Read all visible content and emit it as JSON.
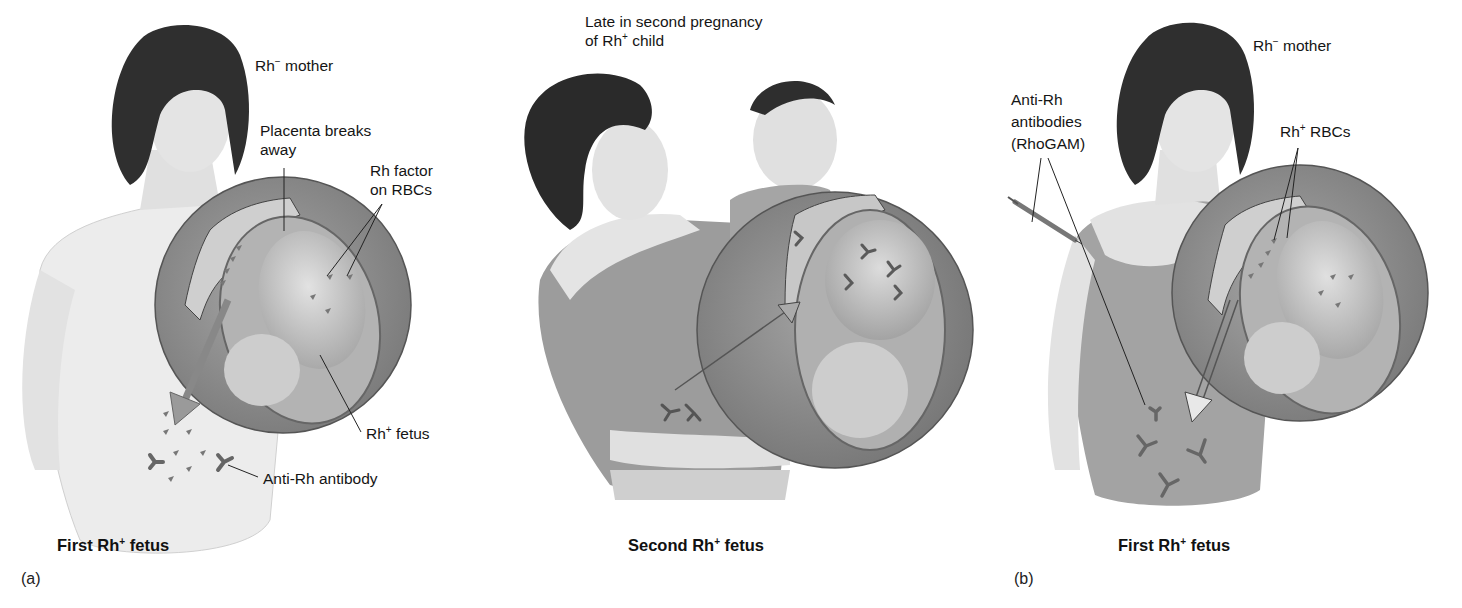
{
  "figure": {
    "panels": [
      {
        "id": "a",
        "letter": "(a)",
        "caption_pre": "First Rh",
        "caption_sup": "+",
        "caption_post": " fetus",
        "labels": {
          "mother_pre": "Rh",
          "mother_sup": "−",
          "mother_post": " mother",
          "placenta_line1": "Placenta breaks",
          "placenta_line2": "away",
          "rhfactor_line1": "Rh factor",
          "rhfactor_line2": "on RBCs",
          "fetus_pre": "Rh",
          "fetus_sup": "+",
          "fetus_post": " fetus",
          "antibody": "Anti-Rh antibody"
        }
      },
      {
        "id": "a-second",
        "letter": "",
        "caption_pre": "Second Rh",
        "caption_sup": "+",
        "caption_post": " fetus",
        "labels": {
          "title_line1": "Late in second pregnancy",
          "title_line2_pre": "of Rh",
          "title_line2_sup": "+",
          "title_line2_post": " child"
        }
      },
      {
        "id": "b",
        "letter": "(b)",
        "caption_pre": "First Rh",
        "caption_sup": "+",
        "caption_post": " fetus",
        "labels": {
          "mother_pre": "Rh",
          "mother_sup": "−",
          "mother_post": " mother",
          "rhogam_line1": "Anti-Rh",
          "rhogam_line2": "antibodies",
          "rhogam_line3": "(RhoGAM)",
          "rbcs_pre": "Rh",
          "rbcs_sup": "+",
          "rbcs_post": " RBCs"
        }
      }
    ],
    "colors": {
      "background": "#ffffff",
      "hair": "#2b2b2b",
      "skin": "#e6e6e6",
      "womb_outer": "#8a8a8a",
      "womb_inner": "#bdbdbd",
      "fetus": "#d2d2d2",
      "text": "#151515"
    }
  }
}
